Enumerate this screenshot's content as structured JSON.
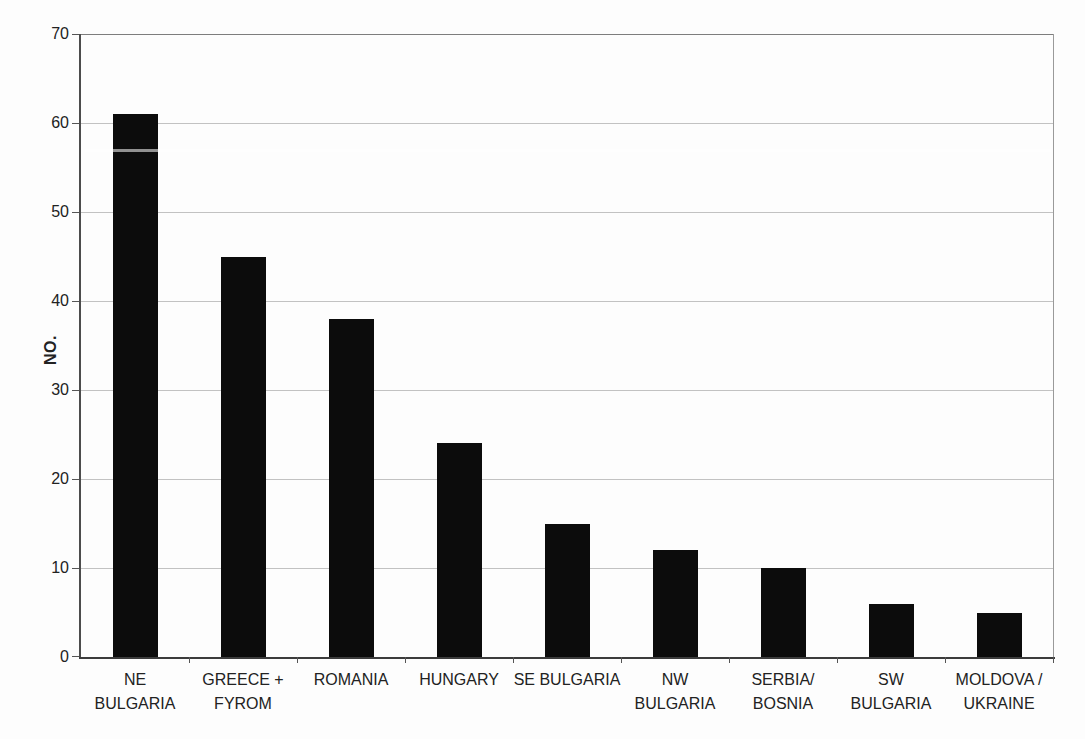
{
  "page": {
    "width": 1085,
    "height": 739,
    "background": "#fdfdfd"
  },
  "colors": {
    "background": "#fdfdfd",
    "bar": "#0c0c0c",
    "gridline": "#c2c2c2",
    "axis_y": "#4c4c4c",
    "axis_x": "#3c3c3c",
    "border_top": "#7d7d7d",
    "border_right": "#9a9a9a",
    "tick": "#555555",
    "text": "#222222"
  },
  "chart_data": {
    "type": "bar",
    "title": "",
    "xlabel": "",
    "ylabel": "NO.",
    "ylim": [
      0,
      70
    ],
    "yticks": [
      0,
      10,
      20,
      30,
      40,
      50,
      60,
      70
    ],
    "grid": true,
    "legend": false,
    "bar_color": "#0c0c0c",
    "categories": [
      "NE BULGARIA",
      "GREECE + FYROM",
      "ROMANIA",
      "HUNGARY",
      "SE BULGARIA",
      "NW BULGARIA",
      "SERBIA/BOSNIA",
      "SW BULGARIA",
      "MOLDOVA / UKRAINE"
    ],
    "category_lines": [
      [
        "NE",
        "BULGARIA"
      ],
      [
        "GREECE +",
        "FYROM"
      ],
      [
        "ROMANIA"
      ],
      [
        "HUNGARY"
      ],
      [
        "SE BULGARIA"
      ],
      [
        "NW",
        "BULGARIA"
      ],
      [
        "SERBIA/",
        "BOSNIA"
      ],
      [
        "SW",
        "BULGARIA"
      ],
      [
        "MOLDOVA /",
        "UKRAINE"
      ]
    ],
    "values": [
      61,
      45,
      38,
      24,
      15,
      12,
      10,
      6,
      5
    ]
  }
}
